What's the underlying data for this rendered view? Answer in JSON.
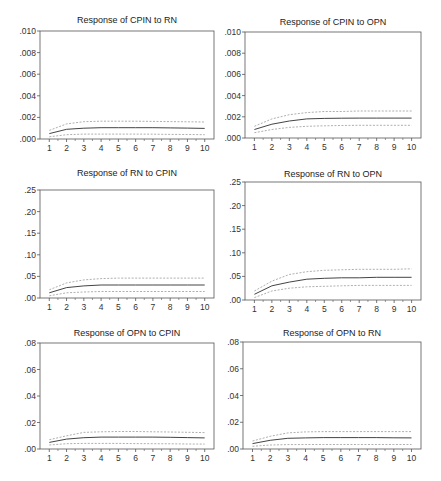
{
  "figure": {
    "colors": {
      "axis": "#555555",
      "response": "#444444",
      "band": "#9a9a9a"
    }
  },
  "chart_data": [
    {
      "type": "line",
      "title": "Response of CPIN to RN",
      "x": [
        1,
        2,
        3,
        4,
        5,
        6,
        7,
        8,
        9,
        10
      ],
      "xlabel": "",
      "ylabel": "",
      "ylim": [
        0,
        0.01
      ],
      "yticks": [
        ".000",
        ".002",
        ".004",
        ".006",
        ".008",
        ".010"
      ],
      "grid": false,
      "series": [
        {
          "name": "response",
          "style": "solid",
          "values": [
            0.0005,
            0.0009,
            0.001,
            0.00105,
            0.00105,
            0.00105,
            0.00105,
            0.00103,
            0.00101,
            0.00098
          ]
        },
        {
          "name": "upper band",
          "style": "dashed",
          "values": [
            0.0008,
            0.0014,
            0.0016,
            0.00165,
            0.00165,
            0.00165,
            0.00163,
            0.00161,
            0.00159,
            0.00157
          ]
        },
        {
          "name": "lower band",
          "style": "dashed",
          "values": [
            0.0002,
            0.0004,
            0.00045,
            0.00045,
            0.00045,
            0.00045,
            0.00044,
            0.00043,
            0.00042,
            0.0004
          ]
        }
      ]
    },
    {
      "type": "line",
      "title": "Response of CPIN to OPN",
      "x": [
        1,
        2,
        3,
        4,
        5,
        6,
        7,
        8,
        9,
        10
      ],
      "xlabel": "",
      "ylabel": "",
      "ylim": [
        0,
        0.01
      ],
      "yticks": [
        ".000",
        ".002",
        ".004",
        ".006",
        ".008",
        ".010"
      ],
      "grid": false,
      "series": [
        {
          "name": "response",
          "style": "solid",
          "values": [
            0.0008,
            0.0013,
            0.0016,
            0.0018,
            0.00185,
            0.00187,
            0.00188,
            0.00188,
            0.00188,
            0.00188
          ]
        },
        {
          "name": "upper band",
          "style": "dashed",
          "values": [
            0.0011,
            0.0018,
            0.0022,
            0.0024,
            0.0025,
            0.0025,
            0.00255,
            0.00255,
            0.00255,
            0.00255
          ]
        },
        {
          "name": "lower band",
          "style": "dashed",
          "values": [
            0.0005,
            0.0008,
            0.001,
            0.0011,
            0.00115,
            0.00118,
            0.0012,
            0.0012,
            0.0012,
            0.0012
          ]
        }
      ]
    },
    {
      "type": "line",
      "title": "Response of RN to CPIN",
      "x": [
        1,
        2,
        3,
        4,
        5,
        6,
        7,
        8,
        9,
        10
      ],
      "xlabel": "",
      "ylabel": "",
      "ylim": [
        0,
        0.25
      ],
      "yticks": [
        ".00",
        ".05",
        ".10",
        ".15",
        ".20",
        ".25"
      ],
      "grid": false,
      "series": [
        {
          "name": "response",
          "style": "solid",
          "values": [
            0.012,
            0.024,
            0.028,
            0.03,
            0.03,
            0.03,
            0.03,
            0.03,
            0.03,
            0.03
          ]
        },
        {
          "name": "upper band",
          "style": "dashed",
          "values": [
            0.019,
            0.035,
            0.042,
            0.045,
            0.046,
            0.046,
            0.046,
            0.046,
            0.046,
            0.046
          ]
        },
        {
          "name": "lower band",
          "style": "dashed",
          "values": [
            0.005,
            0.012,
            0.014,
            0.015,
            0.015,
            0.015,
            0.015,
            0.015,
            0.015,
            0.015
          ]
        }
      ]
    },
    {
      "type": "line",
      "title": "Response of RN to OPN",
      "x": [
        1,
        2,
        3,
        4,
        5,
        6,
        7,
        8,
        9,
        10
      ],
      "xlabel": "",
      "ylabel": "",
      "ylim": [
        0,
        0.25
      ],
      "yticks": [
        ".00",
        ".05",
        ".10",
        ".15",
        ".20",
        ".25"
      ],
      "grid": false,
      "series": [
        {
          "name": "response",
          "style": "solid",
          "values": [
            0.012,
            0.03,
            0.038,
            0.044,
            0.046,
            0.047,
            0.047,
            0.048,
            0.048,
            0.048
          ]
        },
        {
          "name": "upper band",
          "style": "dashed",
          "values": [
            0.019,
            0.04,
            0.054,
            0.06,
            0.063,
            0.064,
            0.065,
            0.065,
            0.065,
            0.066
          ]
        },
        {
          "name": "lower band",
          "style": "dashed",
          "values": [
            0.005,
            0.019,
            0.025,
            0.028,
            0.029,
            0.03,
            0.031,
            0.031,
            0.031,
            0.031
          ]
        }
      ]
    },
    {
      "type": "line",
      "title": "Response of OPN to CPIN",
      "x": [
        1,
        2,
        3,
        4,
        5,
        6,
        7,
        8,
        9,
        10
      ],
      "xlabel": "",
      "ylabel": "",
      "ylim": [
        0,
        0.08
      ],
      "yticks": [
        ".00",
        ".02",
        ".04",
        ".06",
        ".08"
      ],
      "grid": false,
      "series": [
        {
          "name": "response",
          "style": "solid",
          "values": [
            0.005,
            0.0075,
            0.0085,
            0.009,
            0.009,
            0.009,
            0.009,
            0.0088,
            0.0086,
            0.0084
          ]
        },
        {
          "name": "upper band",
          "style": "dashed",
          "values": [
            0.007,
            0.01,
            0.0125,
            0.013,
            0.0132,
            0.0132,
            0.013,
            0.0128,
            0.0126,
            0.0124
          ]
        },
        {
          "name": "lower band",
          "style": "dashed",
          "values": [
            0.003,
            0.004,
            0.0042,
            0.0042,
            0.0042,
            0.0041,
            0.004,
            0.0039,
            0.0038,
            0.0037
          ]
        }
      ]
    },
    {
      "type": "line",
      "title": "Response of OPN to RN",
      "x": [
        1,
        2,
        3,
        4,
        5,
        6,
        7,
        8,
        9,
        10
      ],
      "xlabel": "",
      "ylabel": "",
      "ylim": [
        0,
        0.08
      ],
      "yticks": [
        ".00",
        ".02",
        ".04",
        ".06",
        ".08"
      ],
      "grid": false,
      "series": [
        {
          "name": "response",
          "style": "solid",
          "values": [
            0.004,
            0.0065,
            0.008,
            0.0083,
            0.0085,
            0.0085,
            0.0085,
            0.0085,
            0.0084,
            0.0083
          ]
        },
        {
          "name": "upper band",
          "style": "dashed",
          "values": [
            0.006,
            0.0095,
            0.012,
            0.0128,
            0.013,
            0.013,
            0.013,
            0.013,
            0.013,
            0.013
          ]
        },
        {
          "name": "lower band",
          "style": "dashed",
          "values": [
            0.002,
            0.003,
            0.0033,
            0.0034,
            0.0034,
            0.0034,
            0.0034,
            0.0034,
            0.0034,
            0.0034
          ]
        }
      ]
    }
  ]
}
